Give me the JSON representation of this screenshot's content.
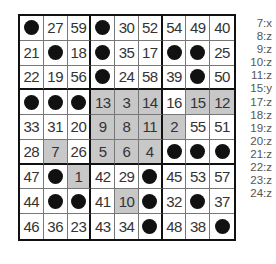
{
  "puzzle": {
    "rows": [
      [
        "●",
        "27",
        "59",
        "●",
        "30",
        "52",
        "54",
        "49",
        "40"
      ],
      [
        "21",
        "●",
        "18",
        "●",
        "35",
        "17",
        "●",
        "●",
        "25"
      ],
      [
        "22",
        "19",
        "56",
        "●",
        "24",
        "58",
        "39",
        "●",
        "50"
      ],
      [
        "●",
        "●",
        "●",
        "13",
        "3",
        "14",
        "16",
        "15",
        "12"
      ],
      [
        "33",
        "31",
        "20",
        "9",
        "8",
        "11",
        "2",
        "55",
        "51"
      ],
      [
        "28",
        "7",
        "26",
        "5",
        "6",
        "4",
        "●",
        "●",
        "●"
      ],
      [
        "47",
        "●",
        "1",
        "42",
        "29",
        "●",
        "45",
        "53",
        "57"
      ],
      [
        "44",
        "●",
        "●",
        "41",
        "10",
        "●",
        "32",
        "●",
        "37"
      ],
      [
        "46",
        "36",
        "23",
        "43",
        "34",
        "●",
        "48",
        "38",
        "●"
      ]
    ],
    "shaded": [
      [
        3,
        3
      ],
      [
        3,
        4
      ],
      [
        3,
        5
      ],
      [
        3,
        7
      ],
      [
        3,
        8
      ],
      [
        4,
        3
      ],
      [
        4,
        4
      ],
      [
        4,
        5
      ],
      [
        4,
        6
      ],
      [
        5,
        1
      ],
      [
        5,
        3
      ],
      [
        5,
        4
      ],
      [
        5,
        5
      ],
      [
        6,
        2
      ],
      [
        7,
        4
      ]
    ],
    "colors": {
      "shaded": "#c8c8c8",
      "dot": "#111111",
      "border": "#111111"
    }
  },
  "legend": [
    "7:x",
    "8:z",
    "9:z",
    "10:z",
    "11:z",
    "15:y",
    "17:z",
    "18:z",
    "19:z",
    "20:z",
    "21:z",
    "22:z",
    "23:z",
    "24:z"
  ]
}
